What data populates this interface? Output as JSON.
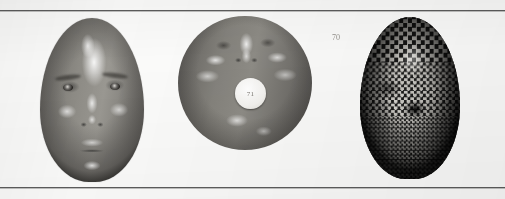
{
  "figure": {
    "caption": "",
    "background_color": "#fbfbfa",
    "rule_color": "#5d5d5d",
    "panels": [
      {
        "id": "panel-a",
        "name": "shaded-face-render",
        "description": "Shaded 3-D human face model, frontal view, specular highlights",
        "annotation": ""
      },
      {
        "id": "panel-b",
        "name": "spherical-face-morph",
        "description": "Face morphed onto a sphere / disc, frontal view with circular white patch",
        "annotation": "71",
        "margin_mark": "70"
      },
      {
        "id": "panel-c",
        "name": "checkerboard-textured-face",
        "description": "3-D face model with checkerboard texture mapping showing mesh parameterisation",
        "annotation": ""
      }
    ]
  }
}
